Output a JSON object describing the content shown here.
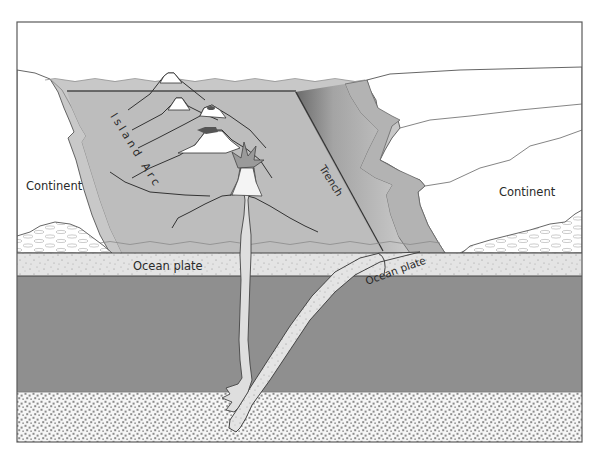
{
  "diagram": {
    "type": "cross-section",
    "labels": {
      "continent_left": "Continent",
      "continent_right": "Continent",
      "island_arc": "Island Arc",
      "trench": "Trench",
      "ocean_plate_flat": "Ocean plate",
      "ocean_plate_subducting": "Ocean plate"
    },
    "colors": {
      "frame": "#5a5a5a",
      "sea": "#c8c8c8",
      "sea_block": "#bdbdbd",
      "shelf": "#b2b2b2",
      "ocean_plate": "#e4e4e4",
      "mantle": "#8f8f8f",
      "asthenosphere_bg": "#f4f4f4",
      "asthenosphere_dots": "#8c8c8c",
      "continent": "#ffffff",
      "trench_dark": "#6e6e6e",
      "volcano_snow": "#ffffff",
      "crater": "#555555",
      "magma": "#dedede",
      "line": "#3c3c3c"
    },
    "layers": [
      {
        "name": "sea",
        "y_top": 80,
        "y_bottom": 253
      },
      {
        "name": "ocean plate",
        "y_top": 253,
        "y_bottom": 276
      },
      {
        "name": "mantle",
        "y_top": 276,
        "y_bottom": 392
      },
      {
        "name": "asthenosphere",
        "y_top": 392,
        "y_bottom": 442
      }
    ],
    "volcano_count": 4
  }
}
